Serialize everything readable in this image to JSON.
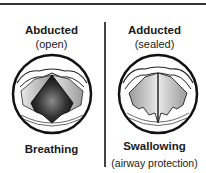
{
  "panels": [
    {
      "title": "Abducted",
      "subtitle": "(open)",
      "caption": "Breathing",
      "caption_detail": "",
      "state": "open",
      "colors": {
        "glottis": "#222222",
        "folds": "#bdbdbd"
      }
    },
    {
      "title": "Adducted",
      "subtitle": "(sealed)",
      "caption": "Swallowing",
      "caption_detail": "(airway protection)",
      "state": "sealed",
      "colors": {
        "folds": "#c4c4c4"
      }
    }
  ]
}
